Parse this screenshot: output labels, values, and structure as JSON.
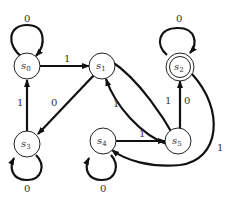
{
  "diagram": {
    "type": "finite-state-machine",
    "states": [
      {
        "id": "s0",
        "label": "s",
        "sub": "0",
        "accepting": false
      },
      {
        "id": "s1",
        "label": "s",
        "sub": "1",
        "accepting": false
      },
      {
        "id": "s2",
        "label": "s",
        "sub": "2",
        "accepting": true
      },
      {
        "id": "s3",
        "label": "s",
        "sub": "3",
        "accepting": false
      },
      {
        "id": "s4",
        "label": "s",
        "sub": "4",
        "accepting": false
      },
      {
        "id": "s5",
        "label": "s",
        "sub": "5",
        "accepting": false
      }
    ],
    "transitions": [
      {
        "from": "s0",
        "to": "s0",
        "label": "0"
      },
      {
        "from": "s0",
        "to": "s1",
        "label": "1"
      },
      {
        "from": "s1",
        "to": "s3",
        "label": "0"
      },
      {
        "from": "s1",
        "to": "s5",
        "label": "1"
      },
      {
        "from": "s5",
        "to": "s1",
        "label": "1"
      },
      {
        "from": "s2",
        "to": "s2",
        "label": "0"
      },
      {
        "from": "s5",
        "to": "s2",
        "label": "0"
      },
      {
        "from": "s2",
        "to": "s4",
        "label": "1"
      },
      {
        "from": "s3",
        "to": "s0",
        "label": "1"
      },
      {
        "from": "s3",
        "to": "s3",
        "label": "0"
      },
      {
        "from": "s4",
        "to": "s4",
        "label": "0"
      },
      {
        "from": "s4",
        "to": "s5",
        "label": "1"
      }
    ],
    "edge_labels": {
      "s0_loop": "0",
      "s0_s1": "1",
      "s1_s3": "0",
      "s1_s5": "1",
      "s5_s1": "1",
      "s2_loop": "0",
      "s5_s2": "0",
      "s2_s4": "1",
      "s3_s0": "1",
      "s3_loop": "0",
      "s4_loop": "0",
      "s4_s5": "1"
    }
  }
}
